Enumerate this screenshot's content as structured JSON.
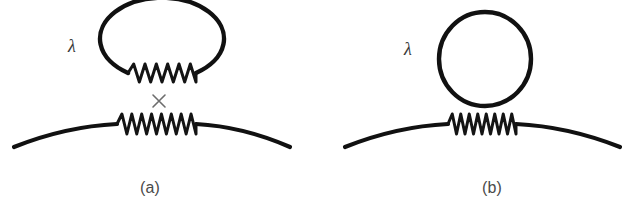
{
  "figure": {
    "background_color": "#ffffff",
    "ink_color": "#111111",
    "caption_color": "#4a4a4a",
    "cross_color": "#6d6d6d",
    "width": 627,
    "height": 213
  },
  "panels": [
    {
      "id": "a",
      "caption": "(a)",
      "caption_x": 150,
      "caption_y": 193,
      "coupling_label": "λ",
      "coupling_label_x": 72,
      "coupling_label_y": 52,
      "loop": {
        "name": "oval-loop-with-spring",
        "shape": "oval",
        "cx": 158,
        "cy": 47,
        "rx": 62,
        "ry": 41,
        "spring_zigzag_peaks": 6,
        "spring_x_start": 128,
        "spring_x_end": 196,
        "spring_y": 73,
        "spring_amplitude": 9
      },
      "vertex_mark": {
        "name": "cross-vertex",
        "symbol": "×",
        "cx": 159,
        "cy": 101,
        "size": 6
      },
      "propagator": {
        "name": "curved-propagator-line",
        "x_start": 14,
        "x_end": 290,
        "y_end": 147,
        "y_apex": 124,
        "spring_zigzag_peaks": 8,
        "spring_x_start": 117,
        "spring_x_end": 196,
        "spring_y": 124,
        "spring_amplitude": 10
      }
    },
    {
      "id": "b",
      "caption": "(b)",
      "caption_x": 492,
      "caption_y": 193,
      "coupling_label": "λ",
      "coupling_label_x": 408,
      "coupling_label_y": 55,
      "loop": {
        "name": "circle-loop",
        "shape": "circle",
        "cx": 485,
        "cy": 59,
        "rx": 46,
        "ry": 47,
        "spring_zigzag_peaks": 0
      },
      "vertex_mark": null,
      "propagator": {
        "name": "curved-propagator-line",
        "x_start": 345,
        "x_end": 620,
        "y_end": 147,
        "y_apex": 124,
        "spring_zigzag_peaks": 8,
        "spring_x_start": 448,
        "spring_x_end": 516,
        "spring_y": 124,
        "spring_amplitude": 10
      }
    }
  ]
}
